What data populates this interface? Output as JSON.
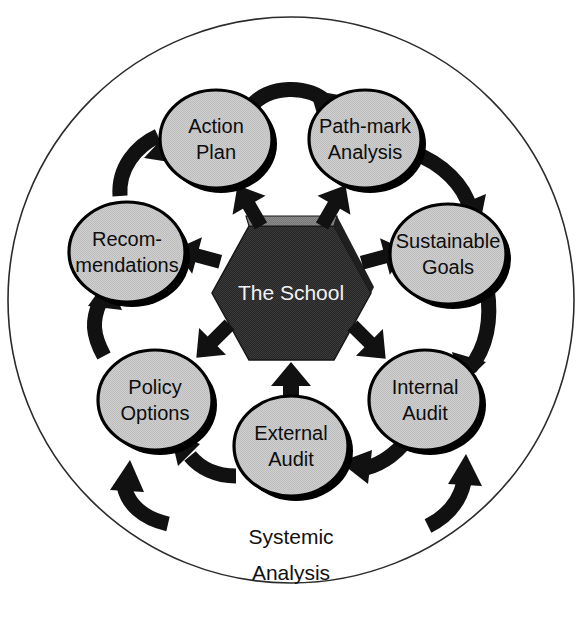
{
  "diagram": {
    "title_caption": {
      "line1": "Systemic",
      "line2": "Analysis"
    },
    "center": {
      "name": "center-hexagon",
      "label": "The School",
      "fill_color": "#2b2b2b",
      "top_facet_color": "#6e6e6e",
      "text_color": "#f2f2f2"
    },
    "outer_boundary": {
      "name": "outer-circle",
      "stroke_color": "#2b2b2b"
    },
    "palette": {
      "node_fill": "#c9c9c9",
      "node_stroke": "#000000",
      "arrow_color": "#111111",
      "background": "#ffffff",
      "label_text": "#0d0d0d"
    },
    "nodes": [
      {
        "id": "action-plan",
        "lines": [
          "Action",
          "Plan"
        ],
        "cx": 216,
        "cy": 139,
        "rx": 56,
        "ry": 49
      },
      {
        "id": "path-mark-analysis",
        "lines": [
          "Path-mark",
          "Analysis"
        ],
        "cx": 365,
        "cy": 139,
        "rx": 56,
        "ry": 49
      },
      {
        "id": "sustainable-goals",
        "lines": [
          "Sustainable",
          "Goals"
        ],
        "cx": 448,
        "cy": 254,
        "rx": 58,
        "ry": 50
      },
      {
        "id": "internal-audit",
        "lines": [
          "Internal",
          "Audit"
        ],
        "cx": 425,
        "cy": 400,
        "rx": 56,
        "ry": 50
      },
      {
        "id": "external-audit",
        "lines": [
          "External",
          "Audit"
        ],
        "cx": 291,
        "cy": 446,
        "rx": 57,
        "ry": 50
      },
      {
        "id": "policy-options",
        "lines": [
          "Policy",
          "Options"
        ],
        "cx": 155,
        "cy": 400,
        "rx": 57,
        "ry": 50
      },
      {
        "id": "recommendations",
        "lines": [
          "Recom-",
          "mendations"
        ],
        "cx": 127,
        "cy": 252,
        "rx": 58,
        "ry": 50
      }
    ],
    "inward_arrows": [
      {
        "id": "arrow-from-action-plan",
        "direction": "down-right"
      },
      {
        "id": "arrow-from-path-mark-analysis",
        "direction": "down-left"
      },
      {
        "id": "arrow-from-sustainable-goals",
        "direction": "left"
      },
      {
        "id": "arrow-from-internal-audit",
        "direction": "up-left"
      },
      {
        "id": "arrow-from-external-audit",
        "direction": "up"
      },
      {
        "id": "arrow-from-policy-options",
        "direction": "up-right"
      },
      {
        "id": "arrow-from-recommendations",
        "direction": "right"
      }
    ],
    "ring_arrows": [
      {
        "id": "ring-arrow-recommendations-to-action-plan",
        "flow": "clockwise"
      },
      {
        "id": "ring-arrow-action-plan-to-path-mark",
        "flow": "clockwise"
      },
      {
        "id": "ring-arrow-path-mark-to-sustainable-goals",
        "flow": "clockwise"
      },
      {
        "id": "ring-arrow-sustainable-goals-to-internal-audit",
        "flow": "clockwise"
      },
      {
        "id": "ring-arrow-internal-audit-to-external-audit",
        "flow": "counter-clockwise"
      },
      {
        "id": "ring-arrow-external-audit-to-policy-options",
        "flow": "counter-clockwise"
      },
      {
        "id": "ring-arrow-policy-options-to-recommendations",
        "flow": "counter-clockwise"
      },
      {
        "id": "ring-arrow-outer-bottom-left",
        "flow": "counter-clockwise"
      },
      {
        "id": "ring-arrow-outer-bottom-right",
        "flow": "counter-clockwise"
      }
    ]
  }
}
